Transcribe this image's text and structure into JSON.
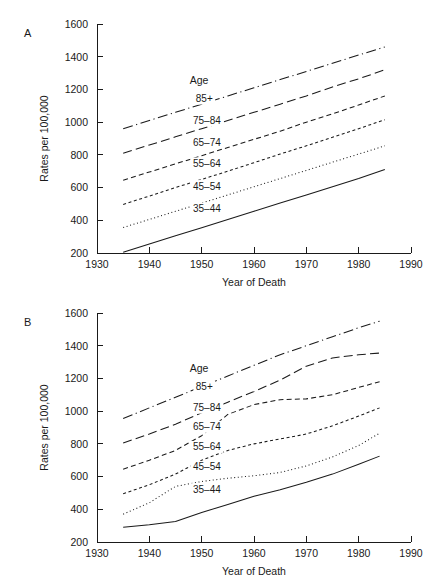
{
  "figure": {
    "panels": [
      {
        "letter": "A"
      },
      {
        "letter": "B"
      }
    ]
  },
  "axes": {
    "xlabel": "Year of Death",
    "ylabel": "Rates per 100,000",
    "legend_title": "Age",
    "x_ticks": [
      "1930",
      "1940",
      "1950",
      "1960",
      "1970",
      "1980",
      "1990"
    ],
    "y_ticks": [
      "1600",
      "1400",
      "1200",
      "1000",
      "800",
      "600",
      "400",
      "200"
    ]
  },
  "series_labels": {
    "s85": "85+",
    "s75": "75–84",
    "s65": "65–74",
    "s55": "55–64",
    "s45": "45–54",
    "s35": "35–44"
  },
  "chart_data": [
    {
      "type": "line",
      "panel": "A",
      "title": "",
      "xlabel": "Year of Death",
      "ylabel": "Rates per 100,000",
      "xlim": [
        1930,
        1990
      ],
      "ylim": [
        200,
        1600
      ],
      "x_ticks": [
        1930,
        1940,
        1950,
        1960,
        1970,
        1980,
        1990
      ],
      "y_ticks": [
        200,
        400,
        600,
        800,
        1000,
        1200,
        1400,
        1600
      ],
      "grid": false,
      "legend": "inline-labels",
      "legend_title": "Age",
      "x": [
        1935,
        1940,
        1945,
        1950,
        1955,
        1960,
        1965,
        1970,
        1975,
        1980,
        1985
      ],
      "series": [
        {
          "name": "85+",
          "style": "dash-dot",
          "values": [
            960,
            1010,
            1060,
            1110,
            1160,
            1210,
            1260,
            1310,
            1360,
            1410,
            1460
          ]
        },
        {
          "name": "75–84",
          "style": "long-dash",
          "values": [
            810,
            860,
            910,
            960,
            1010,
            1060,
            1110,
            1160,
            1215,
            1265,
            1320
          ]
        },
        {
          "name": "65–74",
          "style": "medium-dash",
          "values": [
            645,
            695,
            745,
            795,
            845,
            895,
            945,
            1000,
            1050,
            1105,
            1160
          ]
        },
        {
          "name": "55–64",
          "style": "short-dash",
          "values": [
            497,
            548,
            600,
            650,
            700,
            752,
            805,
            855,
            908,
            960,
            1015
          ]
        },
        {
          "name": "45–54",
          "style": "dotted",
          "values": [
            356,
            405,
            455,
            505,
            555,
            605,
            655,
            705,
            755,
            805,
            855
          ]
        },
        {
          "name": "35–44",
          "style": "solid",
          "values": [
            205,
            255,
            305,
            355,
            405,
            455,
            505,
            555,
            605,
            655,
            710
          ]
        }
      ]
    },
    {
      "type": "line",
      "panel": "B",
      "title": "",
      "xlabel": "Year of Death",
      "ylabel": "Rates per 100,000",
      "xlim": [
        1930,
        1990
      ],
      "ylim": [
        200,
        1600
      ],
      "x_ticks": [
        1930,
        1940,
        1950,
        1960,
        1970,
        1980,
        1990
      ],
      "y_ticks": [
        200,
        400,
        600,
        800,
        1000,
        1200,
        1400,
        1600
      ],
      "grid": false,
      "legend": "inline-labels",
      "legend_title": "Age",
      "x": [
        1935,
        1940,
        1945,
        1950,
        1955,
        1960,
        1965,
        1970,
        1975,
        1980,
        1984
      ],
      "series": [
        {
          "name": "85+",
          "style": "dash-dot",
          "values": [
            955,
            1020,
            1085,
            1150,
            1215,
            1280,
            1345,
            1400,
            1455,
            1510,
            1550
          ]
        },
        {
          "name": "75–84",
          "style": "long-dash",
          "values": [
            805,
            860,
            920,
            990,
            1055,
            1120,
            1190,
            1275,
            1325,
            1345,
            1355
          ]
        },
        {
          "name": "65–74",
          "style": "medium-dash",
          "values": [
            645,
            700,
            760,
            850,
            980,
            1040,
            1070,
            1075,
            1100,
            1145,
            1180
          ]
        },
        {
          "name": "55–64",
          "style": "short-dash",
          "values": [
            495,
            550,
            615,
            700,
            760,
            800,
            830,
            860,
            910,
            970,
            1020
          ]
        },
        {
          "name": "45–54",
          "style": "dotted",
          "values": [
            370,
            440,
            540,
            570,
            590,
            605,
            625,
            665,
            720,
            790,
            865
          ]
        },
        {
          "name": "35–44",
          "style": "solid",
          "values": [
            290,
            305,
            325,
            380,
            430,
            480,
            520,
            565,
            615,
            675,
            725
          ]
        }
      ]
    }
  ],
  "label_positions": {
    "A": {
      "legend_title": {
        "x": 1949.5,
        "y": 1245
      },
      "s85": {
        "x": 1950.5,
        "y": 1135
      },
      "s75": {
        "x": 1951,
        "y": 1003
      },
      "s65": {
        "x": 1951,
        "y": 868
      },
      "s55": {
        "x": 1951,
        "y": 738
      },
      "s45": {
        "x": 1951,
        "y": 600
      },
      "s35": {
        "x": 1951,
        "y": 462
      }
    },
    "B": {
      "legend_title": {
        "x": 1949.5,
        "y": 1250
      },
      "s85": {
        "x": 1950.5,
        "y": 1143
      },
      "s75": {
        "x": 1951,
        "y": 1012
      },
      "s65": {
        "x": 1951,
        "y": 895
      },
      "s55": {
        "x": 1951,
        "y": 772
      },
      "s45": {
        "x": 1951,
        "y": 650
      },
      "s35": {
        "x": 1951,
        "y": 513
      }
    }
  }
}
